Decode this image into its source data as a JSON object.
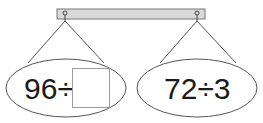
{
  "diagram": {
    "type": "balance-hanger",
    "bar_color": "#d9d9d9",
    "line_color": "#555555",
    "left_pan": {
      "dividend": "96",
      "operator": "÷",
      "divisor": "",
      "divisor_is_blank": true
    },
    "right_pan": {
      "dividend": "72",
      "operator": "÷",
      "divisor": "3"
    }
  }
}
